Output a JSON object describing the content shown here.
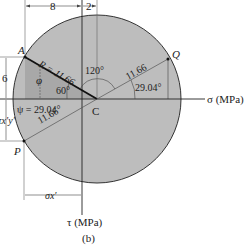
{
  "figure": {
    "caption": "(b)",
    "colors": {
      "circle_fill": "#bdbdbd",
      "shade_fill": "#a8a8a8",
      "line": "#222222",
      "background": "#ffffff"
    }
  },
  "axes": {
    "sigma_label": "σ (MPa)",
    "tau_label": "τ (MPa)"
  },
  "points": {
    "A": "A",
    "C": "C",
    "P": "P",
    "Q": "Q"
  },
  "dimensions": {
    "top_left": "8",
    "top_right": "2",
    "left_vertical": "6",
    "tau_xy": "τx′y′",
    "sigma_x": "σx′"
  },
  "annotations": {
    "radius": "R = 11.66",
    "radius_q": "11.66",
    "radius_p": "11.66",
    "angle_120": "120°",
    "angle_60": "60°",
    "angle_2904_q": "29.04°",
    "phi": "φ",
    "psi": "ψ = 29.04°"
  }
}
